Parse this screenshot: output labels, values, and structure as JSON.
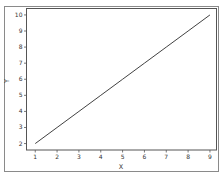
{
  "chart_data": {
    "type": "line",
    "title": "",
    "xlabel": "X",
    "ylabel": "Y",
    "x": [
      1,
      2,
      3,
      4,
      5,
      6,
      7,
      8,
      9
    ],
    "series": [
      {
        "name": "line",
        "values": [
          2,
          3,
          4,
          5,
          6,
          7,
          8,
          9,
          10
        ],
        "color": "#2b2b2b"
      }
    ],
    "xticks": [
      "1",
      "2",
      "3",
      "4",
      "5",
      "6",
      "7",
      "8",
      "9"
    ],
    "yticks": [
      "2",
      "3",
      "4",
      "5",
      "6",
      "7",
      "8",
      "9",
      "10"
    ],
    "xlim": [
      0.6,
      9.3
    ],
    "ylim": [
      1.6,
      10.4
    ],
    "grid": false,
    "legend": "none"
  }
}
